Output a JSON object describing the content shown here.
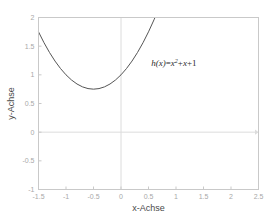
{
  "chart_data": {
    "type": "line",
    "title": "",
    "xlabel": "x-Achse",
    "ylabel": "y-Achse",
    "xlim": [
      -1.5,
      2.5
    ],
    "ylim": [
      -1,
      2
    ],
    "grid": false,
    "legend": null,
    "xticks": [
      "-1.5",
      "-1",
      "-0.5",
      "0",
      "0.5",
      "1",
      "1.5",
      "2",
      "2.5"
    ],
    "xtick_values": [
      -1.5,
      -1,
      -0.5,
      0,
      0.5,
      1,
      1.5,
      2,
      2.5
    ],
    "yticks": [
      "2",
      "1.5",
      "1",
      "0.5",
      "0",
      "-0.5",
      "-1"
    ],
    "ytick_values": [
      2,
      1.5,
      1,
      0.5,
      0,
      -0.5,
      -1
    ],
    "annotations": [
      {
        "text": "h(x)=x²+x+1",
        "parts": {
          "fn": "h",
          "open": "(",
          "var": "x",
          "close": ")",
          "eq": "=",
          "term1": "x",
          "exp": "2",
          "plus1": "+",
          "term2": "x",
          "plus2": "+",
          "term3": "1"
        },
        "x": 0.55,
        "y": 1.15
      }
    ],
    "series": [
      {
        "name": "h(x)=x²+x+1",
        "color": "#555555",
        "formula": "x^2 + x + 1",
        "vertex": [
          -0.5,
          0.75
        ],
        "x": [
          -1.5,
          -1.4,
          -1.3,
          -1.2,
          -1.1,
          -1.0,
          -0.9,
          -0.8,
          -0.7,
          -0.6,
          -0.5,
          -0.4,
          -0.3,
          -0.2,
          -0.1,
          0.0,
          0.1,
          0.2,
          0.3,
          0.4,
          0.5,
          0.6,
          0.65
        ],
        "values": [
          1.75,
          1.56,
          1.39,
          1.24,
          1.11,
          1.0,
          0.91,
          0.84,
          0.79,
          0.76,
          0.75,
          0.76,
          0.79,
          0.84,
          0.91,
          1.0,
          1.11,
          1.24,
          1.39,
          1.56,
          1.75,
          1.96,
          2.073
        ]
      }
    ],
    "reference_lines": [
      {
        "name": "x-zero-line",
        "orientation": "horizontal",
        "value": 0,
        "color": "#dcdcdc"
      },
      {
        "name": "y-zero-line",
        "orientation": "vertical",
        "value": 0,
        "color": "#dcdcdc"
      }
    ]
  },
  "figure": {
    "background": "#ffffff",
    "frame_color": "#c9c9c9",
    "tick_label_color": "#a8a8a8",
    "axis_title_color": "#4a4a4a",
    "annotation_color": "#2b2b2b"
  }
}
